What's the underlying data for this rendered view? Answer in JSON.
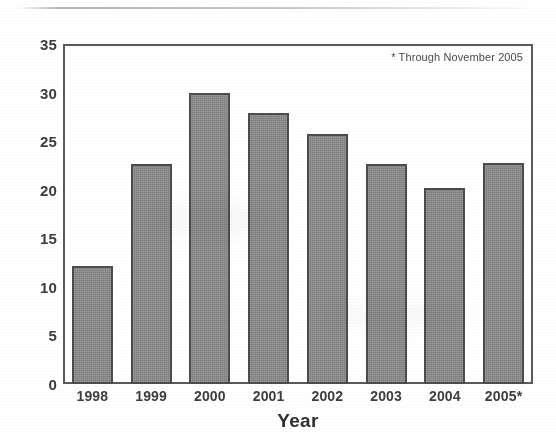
{
  "chart_data": {
    "type": "bar",
    "title": "",
    "subtitle": "",
    "xlabel": "Year",
    "ylabel": "",
    "categories": [
      "1998",
      "1999",
      "2000",
      "2001",
      "2002",
      "2003",
      "2004",
      "2005*"
    ],
    "values": [
      12.2,
      22.7,
      30.0,
      27.9,
      25.7,
      22.6,
      20.2,
      22.8
    ],
    "ylim": [
      0,
      35
    ],
    "ytick_values": [
      0,
      5,
      10,
      15,
      20,
      25,
      30,
      35
    ],
    "ytick_labels": [
      "0",
      "5",
      "10",
      "15",
      "20",
      "25",
      "30",
      "35"
    ],
    "grid": false,
    "legend": null,
    "annotations": [
      {
        "text": "* Through November 2005",
        "position": "top-right-inside-plot"
      }
    ],
    "style": {
      "bar_fill": "#8a8a8a",
      "bar_edge": "#4c4c4c",
      "frame_color": "#5b5b5b",
      "text_color": "#3d3d3d",
      "background": "#ffffff"
    }
  }
}
